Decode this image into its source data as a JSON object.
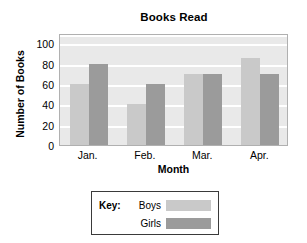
{
  "chart_data": {
    "type": "bar",
    "title": "Books Read",
    "xlabel": "Month",
    "ylabel": "Number of Books",
    "categories": [
      "Jan.",
      "Feb.",
      "Mar.",
      "Apr."
    ],
    "series": [
      {
        "name": "Boys",
        "values": [
          60,
          40,
          70,
          85
        ],
        "color": "#c9c9c9"
      },
      {
        "name": "Girls",
        "values": [
          80,
          60,
          70,
          70
        ],
        "color": "#9b9b9b"
      }
    ],
    "yticks": [
      0,
      20,
      40,
      60,
      80,
      100
    ],
    "ylim": [
      0,
      110
    ],
    "grid": true,
    "grid_color": "#ffffff",
    "plot_background": "#e9e9e9",
    "legend_position": "below-chart"
  },
  "legend": {
    "key_label": "Key:",
    "entries": [
      {
        "label": "Boys",
        "color": "#c9c9c9"
      },
      {
        "label": "Girls",
        "color": "#9b9b9b"
      }
    ]
  }
}
